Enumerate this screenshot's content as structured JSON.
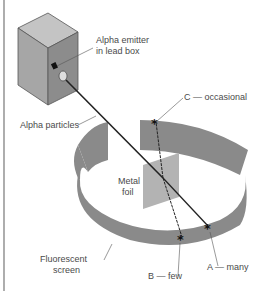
{
  "diagram": {
    "labels": {
      "emitter_line1": "Alpha emitter",
      "emitter_line2": "in lead box",
      "alpha_particles": "Alpha particles",
      "c_occasional": "C — occasional",
      "metal_line1": "Metal",
      "metal_line2": "foil",
      "fluorescent_line1": "Fluorescent",
      "fluorescent_line2": "screen",
      "b_few": "B — few",
      "a_many": "A — many"
    },
    "colors": {
      "box_front": "#a6a6a6",
      "box_side": "#8c8c8c",
      "box_top": "#c4c4c4",
      "screen": "#8a8a8a",
      "foil": "#b3b3b3",
      "beam": "#222222",
      "frame": "#777777"
    },
    "icons": {
      "scintillation": "asterisk"
    }
  }
}
